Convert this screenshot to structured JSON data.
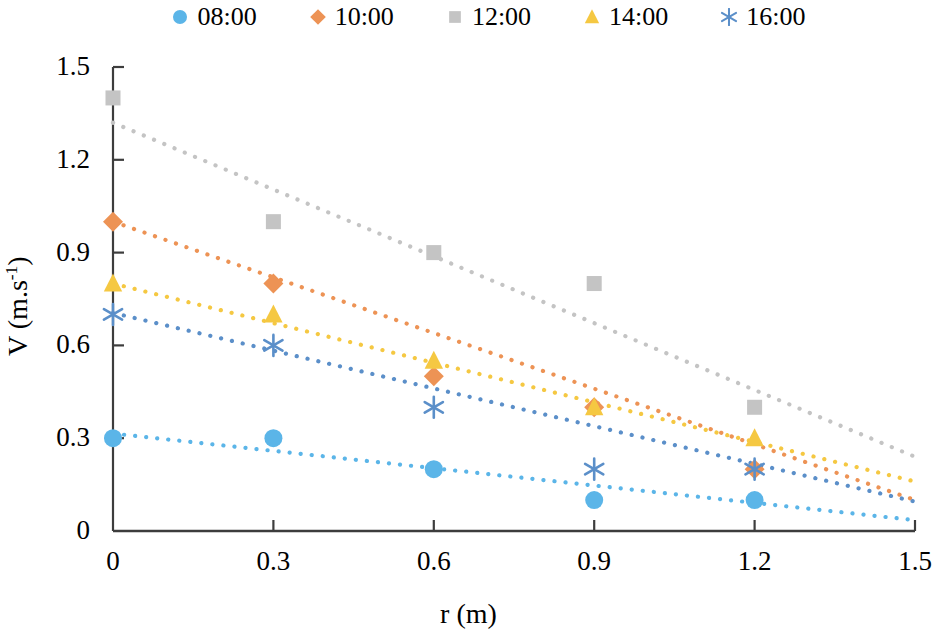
{
  "chart_data": {
    "type": "scatter",
    "title": "",
    "xlabel": "r (m)",
    "ylabel": "V (m.s⁻¹)",
    "xlim": [
      0,
      1.5
    ],
    "ylim": [
      0,
      1.5
    ],
    "xticks": [
      "0",
      "0.3",
      "0.6",
      "0.9",
      "1.2",
      "1.5"
    ],
    "yticks": [
      "0",
      "0.3",
      "0.6",
      "0.9",
      "1.2",
      "1.5"
    ],
    "xtick_values": [
      0,
      0.3,
      0.6,
      0.9,
      1.2,
      1.5
    ],
    "ytick_values": [
      0,
      0.3,
      0.6,
      0.9,
      1.2,
      1.5
    ],
    "grid": false,
    "legend_position": "top",
    "x": [
      0,
      0.3,
      0.6,
      0.9,
      1.2
    ],
    "series": [
      {
        "name": "08:00",
        "marker": "circle",
        "color": "#5BB5E8",
        "values": [
          0.3,
          0.3,
          0.2,
          0.1,
          0.1
        ],
        "trendline": {
          "style": "dotted",
          "x0": 0,
          "y0": 0.315,
          "x1": 1.5,
          "y1": 0.035
        }
      },
      {
        "name": "10:00",
        "marker": "diamond",
        "color": "#ED9355",
        "values": [
          1.0,
          0.8,
          0.5,
          0.4,
          0.2
        ],
        "trendline": {
          "style": "dotted",
          "x0": 0,
          "y0": 1.0,
          "x1": 1.5,
          "y1": 0.1
        }
      },
      {
        "name": "12:00",
        "marker": "square",
        "color": "#C4C4C4",
        "values": [
          1.4,
          1.0,
          0.9,
          0.8,
          0.4
        ],
        "trendline": {
          "style": "dotted",
          "x0": 0,
          "y0": 1.32,
          "x1": 1.5,
          "y1": 0.24
        }
      },
      {
        "name": "14:00",
        "marker": "triangle",
        "color": "#F5C842",
        "values": [
          0.8,
          0.7,
          0.55,
          0.4,
          0.3
        ],
        "trendline": {
          "style": "dotted",
          "x0": 0,
          "y0": 0.8,
          "x1": 1.5,
          "y1": 0.16
        }
      },
      {
        "name": "16:00",
        "marker": "asterisk",
        "color": "#5B8FC9",
        "values": [
          0.7,
          0.6,
          0.4,
          0.2,
          0.2
        ],
        "trendline": {
          "style": "dotted",
          "x0": 0,
          "y0": 0.705,
          "x1": 1.5,
          "y1": 0.095
        }
      }
    ]
  },
  "legend": {
    "items": [
      {
        "label": "08:00",
        "marker": "circle",
        "color": "#5BB5E8"
      },
      {
        "label": "10:00",
        "marker": "diamond",
        "color": "#ED9355"
      },
      {
        "label": "12:00",
        "marker": "square",
        "color": "#C4C4C4"
      },
      {
        "label": "14:00",
        "marker": "triangle",
        "color": "#F5C842"
      },
      {
        "label": "16:00",
        "marker": "asterisk",
        "color": "#5B8FC9"
      }
    ]
  },
  "axes": {
    "x_title": "r (m)",
    "y_title_main": "V (m.s",
    "y_title_sup": "-1",
    "y_title_close": ")",
    "axis_color": "#3d3d3d"
  }
}
